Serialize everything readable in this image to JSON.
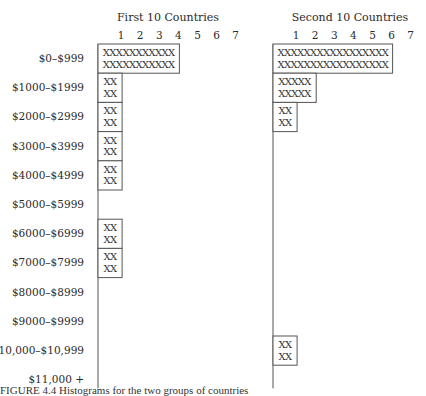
{
  "chart_data": {
    "type": "bar",
    "orientation": "horizontal",
    "style": "tally-histogram",
    "categories": [
      "$0–$999",
      "$1000–$1999",
      "$2000–$2999",
      "$3000–$3999",
      "$4000–$4999",
      "$5000–$5999",
      "$6000–$6999",
      "$7000–$7999",
      "$8000–$8999",
      "$9000–$9999",
      "$10,000–$10,999",
      "$11,000 +"
    ],
    "axis_ticks": [
      "1",
      "2",
      "3",
      "4",
      "5",
      "6",
      "7"
    ],
    "xlim": [
      0,
      7
    ],
    "series": [
      {
        "name": "First 10 Countries",
        "values": [
          4,
          1,
          1,
          1,
          1,
          0,
          1,
          1,
          0,
          0,
          0,
          0
        ],
        "tallies": [
          [
            "XXXXXXXXXXX",
            "XXXXXXXXXXX"
          ],
          [
            "XX",
            "XX"
          ],
          [
            "XX",
            "XX"
          ],
          [
            "XX",
            "XX"
          ],
          [
            "XX",
            "XX"
          ],
          null,
          [
            "XX",
            "XX"
          ],
          [
            "XX",
            "XX"
          ],
          null,
          null,
          null,
          null
        ]
      },
      {
        "name": "Second 10 Countries",
        "values": [
          6,
          2,
          1,
          0,
          0,
          0,
          0,
          0,
          0,
          0,
          1,
          0
        ],
        "tallies": [
          [
            "XXXXXXXXXXXXXXXXX",
            "XXXXXXXXXXXXXXXXX"
          ],
          [
            "XXXXX",
            "XXXXX"
          ],
          [
            "XX",
            "XX"
          ],
          null,
          null,
          null,
          null,
          null,
          null,
          null,
          [
            "XX",
            "XX"
          ],
          null
        ]
      }
    ],
    "title": "",
    "xlabel": "",
    "ylabel": "",
    "grid": false,
    "legend": "none"
  },
  "caption": "FIGURE 4.4  Histograms for the two groups of countries"
}
